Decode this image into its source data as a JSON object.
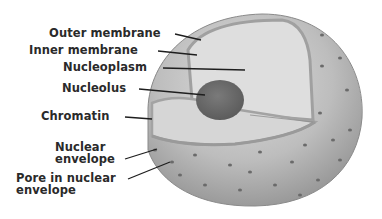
{
  "labels": [
    {
      "id": "outer-membrane",
      "text": "Outer membrane"
    },
    {
      "id": "inner-membrane",
      "text": "Inner membrane"
    },
    {
      "id": "nucleoplasm",
      "text": "Nucleoplasm"
    },
    {
      "id": "nucleolus",
      "text": "Nucleolus"
    },
    {
      "id": "chromatin",
      "text": "Chromatin"
    },
    {
      "id": "nuclear-envelope",
      "line1": "Nuclear",
      "line2": "envelope"
    },
    {
      "id": "pore",
      "line1": "Pore in nuclear",
      "line2": "envelope"
    }
  ],
  "colors": {
    "sphere_light": "#d8d8d8",
    "sphere_dark": "#8a8a8a",
    "cut_face": "#dcdcdc",
    "nucleolus": "#6e6e6e",
    "membrane": "#a8a8a8",
    "text": "#2a2a2a"
  }
}
